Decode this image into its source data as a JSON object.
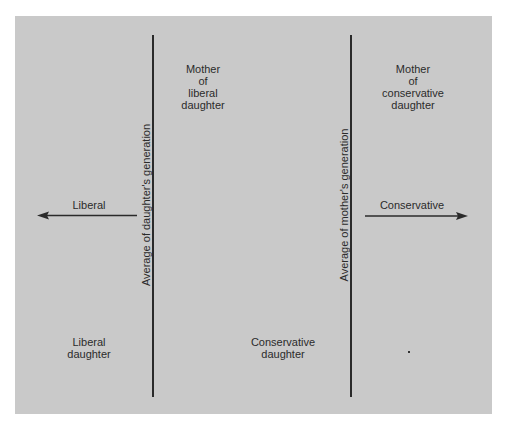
{
  "colors": {
    "background": "#ffffff",
    "panel": "#c9c9c9",
    "ink": "#2b2b2b"
  },
  "diagram": {
    "dividers": [
      {
        "id": "daughters-average",
        "label": "Average of daughter's generation"
      },
      {
        "id": "mothers-average",
        "label": "Average of mother's generation"
      }
    ],
    "direction_arrows": [
      {
        "label": "Liberal",
        "direction": "left"
      },
      {
        "label": "Conservative",
        "direction": "right"
      }
    ],
    "regions": {
      "mother_of_liberal_daughter": [
        "Mother",
        "of",
        "liberal",
        "daughter"
      ],
      "mother_of_conservative_daughter": [
        "Mother",
        "of",
        "conservative",
        "daughter"
      ],
      "liberal_daughter": [
        "Liberal",
        "daughter"
      ],
      "conservative_daughter": [
        "Conservative",
        "daughter"
      ]
    }
  }
}
